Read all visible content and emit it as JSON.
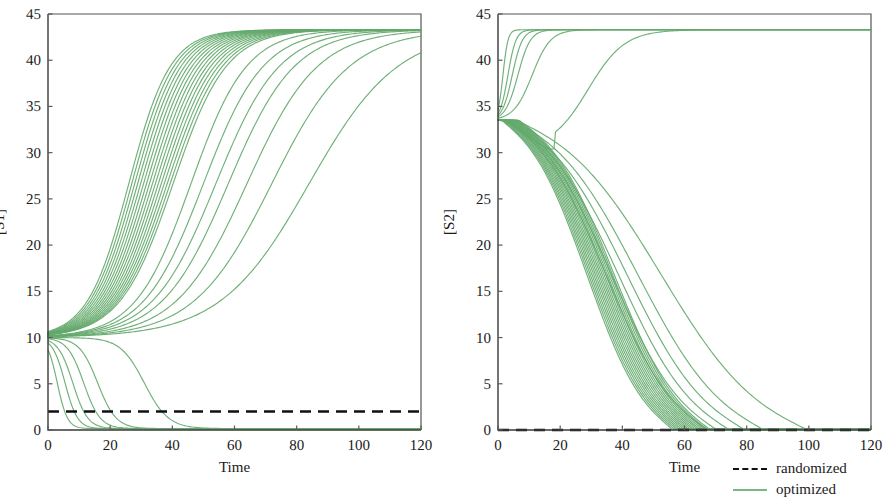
{
  "chart_data": [
    {
      "id": "panel-s1",
      "type": "line",
      "title": "",
      "xlabel": "Time",
      "ylabel": "[S1]",
      "xlim": [
        0,
        120
      ],
      "ylim": [
        0,
        45
      ],
      "xticks": [
        0,
        20,
        40,
        60,
        80,
        100,
        120
      ],
      "yticks": [
        0,
        5,
        10,
        15,
        20,
        25,
        30,
        35,
        40,
        45
      ],
      "grid": false,
      "legend_position": "outside-bottom-right",
      "initial_value": 10,
      "high_steady_state": 43.3,
      "low_steady_state": 0.15,
      "randomized_level": 2.0,
      "series": [
        {
          "name": "randomized",
          "style": "dashed",
          "color": "#111111",
          "x": [
            0,
            120
          ],
          "values": [
            2.0,
            2.0
          ]
        },
        {
          "name": "optimized",
          "style": "solid",
          "color": "#64a96c",
          "description": "30 trajectories from [S1]=10; 24 rise sigmoidally to 43.3, 6 decay to 0",
          "x": [
            0,
            5,
            10,
            15,
            20,
            25,
            30,
            35,
            40,
            45,
            50,
            55,
            60,
            70,
            80,
            90,
            100,
            110,
            120
          ],
          "rising_envelope_fast": [
            10,
            14.5,
            20.0,
            26.0,
            32.0,
            37.2,
            40.8,
            42.6,
            43.2,
            43.3,
            43.3,
            43.3,
            43.3,
            43.3,
            43.3,
            43.3,
            43.3,
            43.3,
            43.3
          ],
          "rising_envelope_slow": [
            10,
            10.6,
            11.6,
            13.0,
            14.8,
            17.0,
            19.6,
            22.6,
            25.8,
            29.2,
            32.6,
            35.8,
            38.4,
            41.8,
            43.0,
            43.3,
            43.3,
            43.3,
            43.3
          ],
          "falling_fast": [
            10,
            2.4,
            0.3,
            0.15,
            0.12,
            0.1,
            0.1,
            0.1,
            0.1,
            0.1,
            0.1,
            0.1,
            0.1,
            0.1,
            0.1,
            0.1,
            0.1,
            0.1,
            0.1
          ],
          "falling_slow": [
            10,
            9.8,
            9.4,
            8.8,
            8.0,
            7.0,
            5.8,
            4.2,
            2.2,
            0.4,
            0.12,
            0.1,
            0.1,
            0.1,
            0.1,
            0.1,
            0.1,
            0.1,
            0.1
          ]
        }
      ]
    },
    {
      "id": "panel-s2",
      "type": "line",
      "title": "",
      "xlabel": "Time",
      "ylabel": "[S2]",
      "xlim": [
        0,
        120
      ],
      "ylim": [
        0,
        45
      ],
      "xticks": [
        0,
        20,
        40,
        60,
        80,
        100,
        120
      ],
      "yticks": [
        0,
        5,
        10,
        15,
        20,
        25,
        30,
        35,
        40,
        45
      ],
      "grid": false,
      "legend_position": "outside-bottom-right",
      "initial_value": 33.5,
      "high_steady_state": 43.3,
      "low_steady_state": 0.1,
      "randomized_level": 0.0,
      "series": [
        {
          "name": "randomized",
          "style": "dashed",
          "color": "#111111",
          "x": [
            0,
            120
          ],
          "values": [
            0.0,
            0.0
          ]
        },
        {
          "name": "optimized",
          "style": "solid",
          "color": "#64a96c",
          "description": "30 trajectories from [S2]=33.5; 6 rise to 43.3, 24 decay linearly then plateau at 0",
          "x": [
            0,
            5,
            10,
            15,
            20,
            25,
            30,
            35,
            40,
            45,
            50,
            55,
            60,
            70,
            80,
            90,
            100,
            110,
            120
          ],
          "rising_fast": [
            33.5,
            42.6,
            43.3,
            43.3,
            43.3,
            43.3,
            43.3,
            43.3,
            43.3,
            43.3,
            43.3,
            43.3,
            43.3,
            43.3,
            43.3,
            43.3,
            43.3,
            43.3,
            43.3
          ],
          "rising_slow": [
            33.5,
            33.0,
            33.4,
            34.6,
            36.4,
            38.6,
            40.8,
            42.4,
            43.1,
            43.3,
            43.3,
            43.3,
            43.3,
            43.3,
            43.3,
            43.3,
            43.3,
            43.3,
            43.3
          ],
          "falling_fast": [
            33.5,
            30.4,
            27.3,
            24.2,
            21.1,
            18.0,
            14.9,
            11.8,
            8.8,
            5.9,
            3.1,
            1.0,
            0.15,
            0.1,
            0.1,
            0.1,
            0.1,
            0.1,
            0.1
          ],
          "falling_slow": [
            33.5,
            32.0,
            30.4,
            28.8,
            27.2,
            25.6,
            24.0,
            22.4,
            20.8,
            19.2,
            17.6,
            16.0,
            14.4,
            11.2,
            7.6,
            4.0,
            1.0,
            0.15,
            0.1
          ]
        }
      ]
    }
  ],
  "legend": {
    "items": [
      {
        "label": "randomized",
        "style": "dashed",
        "color": "#111111"
      },
      {
        "label": "optimized",
        "style": "solid",
        "color": "#7ab882"
      }
    ]
  },
  "panels": {
    "left": {
      "ylabel": "[S1]",
      "xlabel": "Time",
      "yticks": [
        "0",
        "5",
        "10",
        "15",
        "20",
        "25",
        "30",
        "35",
        "40",
        "45"
      ],
      "xticks": [
        "0",
        "20",
        "40",
        "60",
        "80",
        "100",
        "120"
      ]
    },
    "right": {
      "ylabel": "[S2]",
      "xlabel": "Time",
      "yticks": [
        "0",
        "5",
        "10",
        "15",
        "20",
        "25",
        "30",
        "35",
        "40",
        "45"
      ],
      "xticks": [
        "0",
        "20",
        "40",
        "60",
        "80",
        "100",
        "120"
      ]
    }
  },
  "colors": {
    "optimized": "#64a96c",
    "randomized": "#111111",
    "axis": "#3a3a3a",
    "background": "#ffffff"
  }
}
